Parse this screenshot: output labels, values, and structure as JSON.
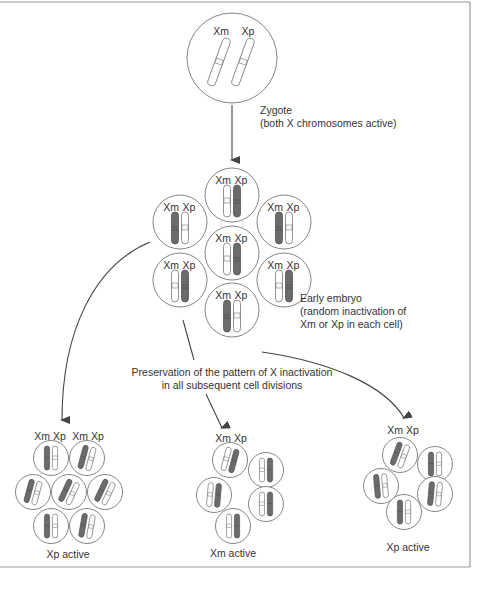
{
  "figure": {
    "zygote": {
      "label_xm": "Xm",
      "label_xp": "Xp",
      "caption_line1": "Zygote",
      "caption_line2": "(both X chromosomes active)"
    },
    "embryo": {
      "caption_line1": "Early embryo",
      "caption_line2": "(random inactivation of",
      "caption_line3": "Xm or Xp in each cell)",
      "cells": [
        {
          "position": "top",
          "inactive": "Xp"
        },
        {
          "position": "upper-left",
          "inactive": "Xm"
        },
        {
          "position": "upper-right",
          "inactive": "Xm"
        },
        {
          "position": "center",
          "inactive": "Xp"
        },
        {
          "position": "lower-left",
          "inactive": "Xp"
        },
        {
          "position": "lower-right",
          "inactive": "Xp"
        },
        {
          "position": "bottom",
          "inactive": "Xm"
        }
      ],
      "label_xm": "Xm",
      "label_xp": "Xp"
    },
    "preservation_caption_line1": "Preservation of the pattern of X inactivation",
    "preservation_caption_line2": "in all subsequent cell divisions",
    "clusters": [
      {
        "name": "left",
        "label": "Xm Xp",
        "label2": "Xm Xp",
        "caption": "Xp active",
        "inactive": "Xm",
        "cell_count": 7
      },
      {
        "name": "middle",
        "label": "Xm Xp",
        "caption": "Xm active",
        "inactive": "Xp",
        "cell_count": 5
      },
      {
        "name": "right",
        "label": "Xm Xp",
        "caption": "Xp active",
        "inactive": "Xm",
        "cell_count": 5
      }
    ]
  },
  "colors": {
    "line": "#555555",
    "inactive_fill": "#6b6b6b",
    "border": "#999999",
    "text": "#333333"
  }
}
